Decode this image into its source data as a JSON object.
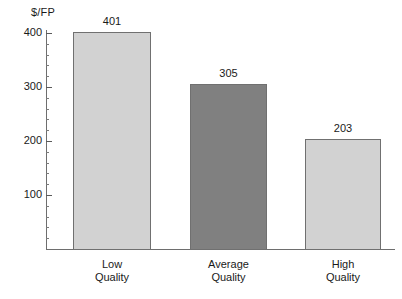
{
  "chart_data": {
    "type": "bar",
    "title": "",
    "xlabel": "",
    "ylabel": "$/FP",
    "categories": [
      "Low Quality",
      "Average Quality",
      "High Quality"
    ],
    "category_lines": [
      [
        "Low",
        "Quality"
      ],
      [
        "Average",
        "Quality"
      ],
      [
        "High",
        "Quality"
      ]
    ],
    "values": [
      401,
      305,
      203
    ],
    "value_labels": [
      "401",
      "305",
      "203"
    ],
    "ylim": [
      0,
      420
    ],
    "y_major_ticks": [
      100,
      200,
      300,
      400
    ],
    "y_tick_labels": [
      "100",
      "200",
      "300",
      "400"
    ],
    "y_minor_tick_step": 20,
    "grid": false,
    "legend": "none",
    "bar_colors": [
      "#d2d2d2",
      "#808080",
      "#d2d2d2"
    ],
    "bar_border_color": "#707070",
    "axis_color": "#6e6e6e"
  }
}
